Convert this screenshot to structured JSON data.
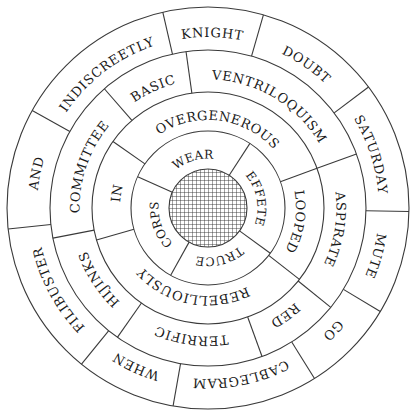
{
  "diagram": {
    "type": "concentric word wheel",
    "center": {
      "x": 208,
      "y": 208,
      "pattern": "crosshatch"
    },
    "colors": {
      "line": "#3a3a3a",
      "text": "#1a1a1a",
      "background": "#ffffff",
      "hatch": "#333333"
    },
    "rings": [
      {
        "name": "outer",
        "r_inner": 158,
        "r_outer": 201,
        "cells": [
          {
            "word": "KNIGHT",
            "start": 347,
            "end": 16
          },
          {
            "word": "DOUBT",
            "start": 16,
            "end": 53
          },
          {
            "word": "SATURDAY",
            "start": 53,
            "end": 91
          },
          {
            "word": "MUTE",
            "start": 91,
            "end": 121
          },
          {
            "word": "GO",
            "start": 121,
            "end": 148
          },
          {
            "word": "CABLEGRAM",
            "start": 148,
            "end": 190
          },
          {
            "word": "WHEN",
            "start": 190,
            "end": 219
          },
          {
            "word": "FILIBUSTER",
            "start": 219,
            "end": 264
          },
          {
            "word": "AND",
            "start": 264,
            "end": 299
          },
          {
            "word": "INDISCREETLY",
            "start": 299,
            "end": 347
          }
        ]
      },
      {
        "name": "second",
        "r_inner": 116,
        "r_outer": 158,
        "cells": [
          {
            "word": "VENTRILOQUISM",
            "start": 352,
            "end": 70
          },
          {
            "word": "ASPIRATE",
            "start": 70,
            "end": 129
          },
          {
            "word": "RED",
            "start": 129,
            "end": 160
          },
          {
            "word": "TERRIFIC",
            "start": 160,
            "end": 215
          },
          {
            "word": "HIJINKS",
            "start": 215,
            "end": 259
          },
          {
            "word": "COMMITTEE",
            "start": 259,
            "end": 319
          },
          {
            "word": "BASIC",
            "start": 319,
            "end": 352
          }
        ]
      },
      {
        "name": "third",
        "r_inner": 77,
        "r_outer": 116,
        "cells": [
          {
            "word": "OVERGENEROUS",
            "start": 305,
            "end": 70
          },
          {
            "word": "LOOPED",
            "start": 70,
            "end": 128
          },
          {
            "word": "REBELLIOUSLY",
            "start": 128,
            "end": 254
          },
          {
            "word": "IN",
            "start": 254,
            "end": 305
          }
        ]
      },
      {
        "name": "inner",
        "r_inner": 39,
        "r_outer": 77,
        "cells": [
          {
            "word": "WEAR",
            "start": 294,
            "end": 33
          },
          {
            "word": "EFFETE",
            "start": 33,
            "end": 126
          },
          {
            "word": "TRUCE",
            "start": 126,
            "end": 209
          },
          {
            "word": "CORPS",
            "start": 209,
            "end": 294
          }
        ]
      }
    ]
  }
}
